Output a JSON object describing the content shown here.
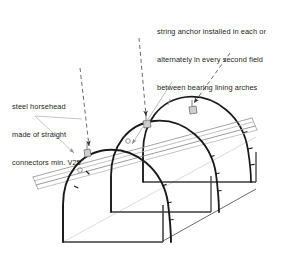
{
  "drawing": {
    "title": "Tunnel lining bearing arches with ridge string anchor",
    "type": "isometric-technical-drawing",
    "colors": {
      "arch_stroke": "#1a1a1a",
      "base_stroke": "#3b3b3b",
      "beam_stroke": "#8e8e8e",
      "leader_dashed": "#5a5a5a",
      "leader_thin": "#b5b5b5",
      "floor_line": "#d8d8d8",
      "text": "#1d1d1d",
      "background": "#ffffff"
    }
  },
  "annotations": {
    "string_anchor": {
      "name": "string-anchor-note",
      "line1": "string anchor installed in each or",
      "line2": "alternately in every second field",
      "line3": "between bearing lining arches"
    },
    "horsehead": {
      "name": "steel-horsehead-note",
      "line1": "steel horsehead",
      "line2": "made of straight",
      "line3": "connectors min. V25"
    }
  },
  "geometry": {
    "arch_count": 3,
    "arches": [
      {
        "id": "arch-front",
        "label": "front bearing lining arch"
      },
      {
        "id": "arch-middle",
        "label": "middle bearing lining arch"
      },
      {
        "id": "arch-rear",
        "label": "rear bearing lining arch"
      }
    ],
    "ridge_beam": {
      "id": "ridge-beam",
      "label": "ridge beam with string anchors"
    },
    "anchors": [
      {
        "id": "anchor-1",
        "label": "string anchor at front arch crown"
      },
      {
        "id": "anchor-2",
        "label": "string anchor at middle arch crown"
      },
      {
        "id": "anchor-3",
        "label": "string anchor at rear arch crown"
      }
    ]
  }
}
